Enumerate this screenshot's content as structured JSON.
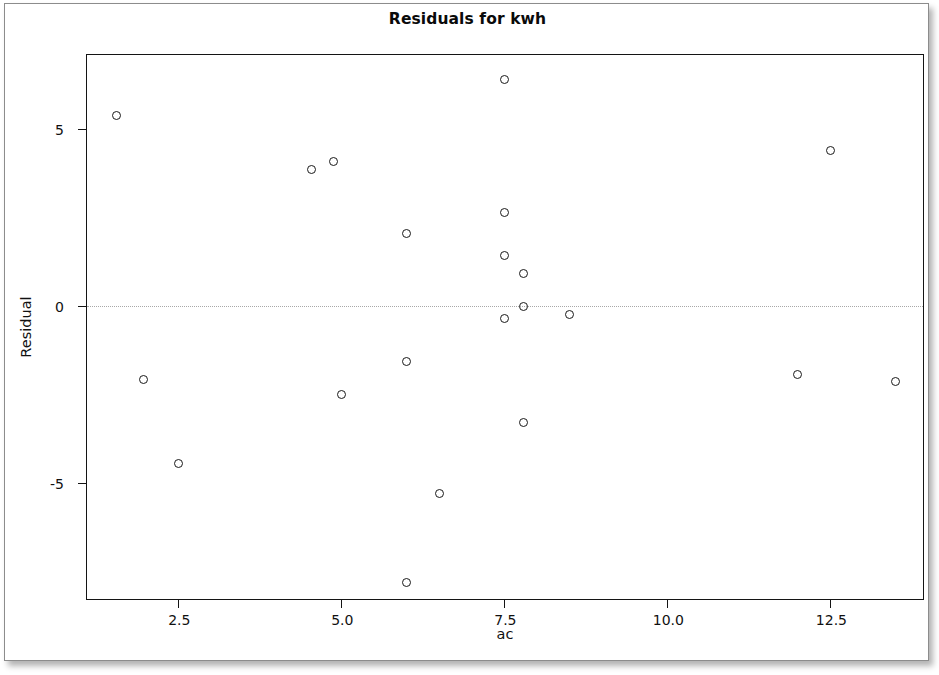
{
  "chart_data": {
    "type": "scatter",
    "title": "Residuals for kwh",
    "xlabel": "ac",
    "ylabel": "Residual",
    "xlim": [
      1.1,
      13.95
    ],
    "ylim": [
      -8.35,
      7.1
    ],
    "xticks": [
      2.5,
      5.0,
      7.5,
      10.0,
      12.5
    ],
    "xticklabels": [
      "2.5",
      "5.0",
      "7.5",
      "10.0",
      "12.5"
    ],
    "yticks": [
      5,
      0,
      -5
    ],
    "yticklabels": [
      "5",
      "0",
      "-5"
    ],
    "grid": false,
    "legend": null,
    "reference_line": {
      "orientation": "horizontal",
      "value": 0,
      "style": "dotted",
      "color": "#a8a8a8"
    },
    "marker": {
      "shape": "open-circle",
      "edge_color": "#1a1a1a",
      "fill": "none",
      "size": 9
    },
    "x": [
      1.55,
      1.97,
      2.5,
      4.55,
      4.88,
      5.0,
      6.0,
      6.0,
      6.0,
      6.5,
      7.5,
      7.5,
      7.5,
      7.5,
      7.8,
      7.8,
      7.8,
      8.5,
      12.0,
      12.5,
      13.5
    ],
    "y": [
      5.4,
      -2.08,
      -4.47,
      3.86,
      4.08,
      -2.5,
      2.06,
      -1.56,
      -7.84,
      -5.3,
      6.4,
      2.64,
      1.42,
      -0.36,
      0.92,
      -0.03,
      -3.3,
      -0.25,
      -1.95,
      4.4,
      -2.15
    ],
    "points": [
      {
        "x": 1.55,
        "y": 5.4
      },
      {
        "x": 1.97,
        "y": -2.08
      },
      {
        "x": 2.5,
        "y": -4.47
      },
      {
        "x": 4.55,
        "y": 3.86
      },
      {
        "x": 4.88,
        "y": 4.08
      },
      {
        "x": 5.0,
        "y": -2.5
      },
      {
        "x": 6.0,
        "y": 2.06
      },
      {
        "x": 6.0,
        "y": -1.56
      },
      {
        "x": 6.0,
        "y": -7.84
      },
      {
        "x": 6.5,
        "y": -5.3
      },
      {
        "x": 7.5,
        "y": 6.4
      },
      {
        "x": 7.5,
        "y": 2.64
      },
      {
        "x": 7.5,
        "y": 1.42
      },
      {
        "x": 7.5,
        "y": -0.36
      },
      {
        "x": 7.8,
        "y": 0.92
      },
      {
        "x": 7.8,
        "y": -0.03
      },
      {
        "x": 7.8,
        "y": -3.3
      },
      {
        "x": 8.5,
        "y": -0.25
      },
      {
        "x": 12.0,
        "y": -1.95
      },
      {
        "x": 12.5,
        "y": 4.4
      },
      {
        "x": 13.5,
        "y": -2.15
      }
    ]
  }
}
